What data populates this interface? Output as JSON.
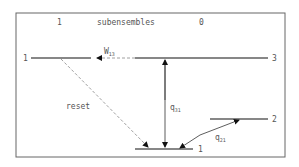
{
  "header": {
    "left_label": "1",
    "title": "subensembles",
    "right_label": "0"
  },
  "levels": {
    "level3_left_label": "1",
    "level3_right_label": "3",
    "level2_label": "2",
    "level1_label": "1"
  },
  "transitions": {
    "w13": {
      "symbol": "W",
      "subscript": "13"
    },
    "reset": "reset",
    "q31": {
      "symbol": "q",
      "subscript": "31"
    },
    "q21": {
      "symbol": "q",
      "subscript": "21"
    }
  }
}
